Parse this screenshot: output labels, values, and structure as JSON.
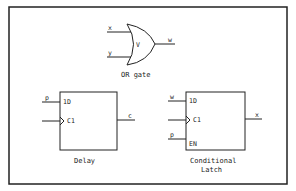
{
  "figure": {
    "or_gate": {
      "inputs": [
        "x",
        "y"
      ],
      "symbol": "V",
      "output": "w",
      "caption": "OR gate"
    },
    "delay": {
      "input_signal": "p",
      "pins": [
        "1D",
        "C1"
      ],
      "output": "c",
      "caption": "Delay"
    },
    "latch": {
      "input_signals": [
        "w",
        "p"
      ],
      "pins": [
        "1D",
        "C1",
        "EN"
      ],
      "output": "x",
      "caption_line1": "Conditional",
      "caption_line2": "Latch"
    }
  }
}
